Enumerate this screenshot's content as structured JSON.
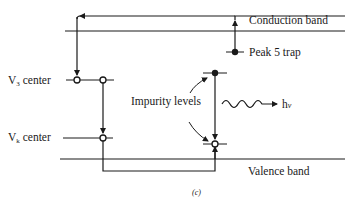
{
  "diagram": {
    "type": "energy-band-diagram",
    "bands": {
      "conduction": "Conduction band",
      "valence": "Valence band"
    },
    "levels": {
      "peak5": "Peak 5 trap",
      "v3": "V",
      "v3_sub": "3",
      "v3_suffix": " center",
      "vk": "V",
      "vk_sub": "k",
      "vk_suffix": " center",
      "impurity": "Impurity levels"
    },
    "emission": {
      "label": "h",
      "label_nu": "ν"
    },
    "caption": "(c)",
    "colors": {
      "ink": "#1a1a1a",
      "background": "#ffffff"
    }
  }
}
